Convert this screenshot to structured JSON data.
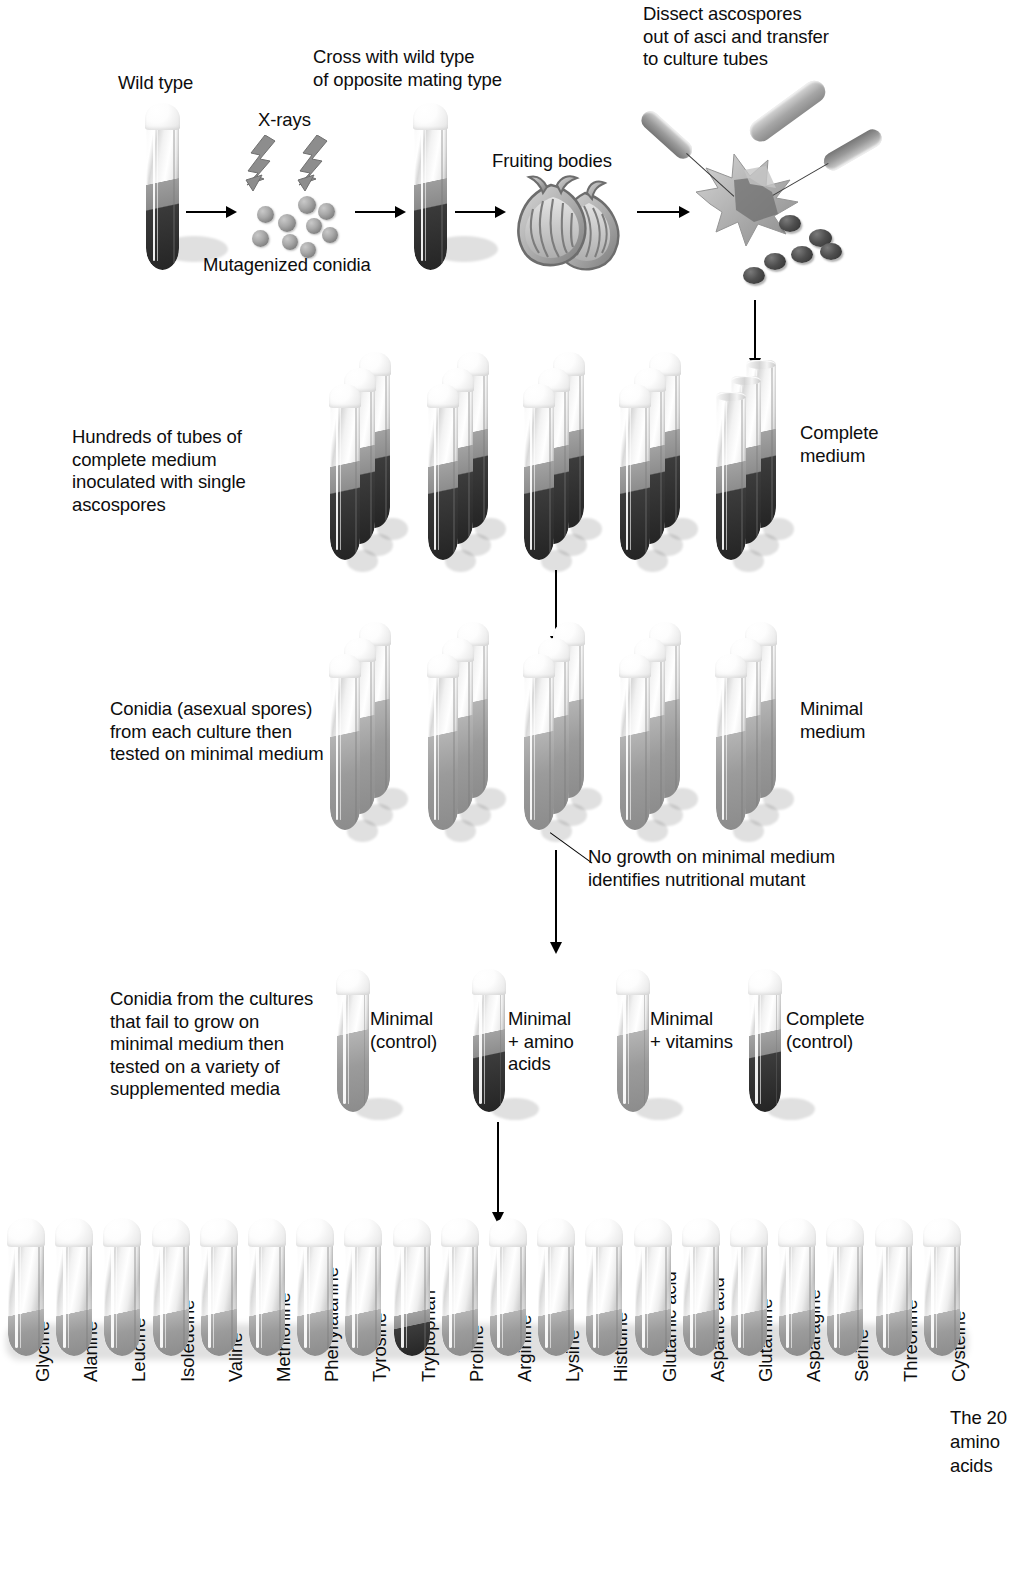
{
  "step1": {
    "wild_type_label": "Wild type",
    "xrays_label": "X-rays",
    "mutagenized_label": "Mutagenized conidia",
    "cross_label": "Cross with wild type\nof opposite mating type",
    "fruiting_bodies_label": "Fruiting bodies",
    "dissect_label": "Dissect ascospores\nout of asci and transfer\nto culture tubes"
  },
  "step2": {
    "description": "Hundreds of tubes of\ncomplete medium\ninoculated with single\nascospores",
    "medium_label": "Complete\nmedium",
    "group_count": 5,
    "tubes_per_group": 3
  },
  "step3": {
    "description": "Conidia (asexual spores)\nfrom each culture then\ntested on minimal medium",
    "medium_label": "Minimal\nmedium",
    "annotation": "No growth on minimal medium\nidentifies nutritional mutant",
    "group_count": 5,
    "tubes_per_group": 3
  },
  "step4": {
    "description": "Conidia from the cultures\nthat fail to grow on\nminimal medium then\ntested on a variety of\nsupplemented media",
    "tubes": [
      {
        "label": "Minimal\n(control)",
        "growth": false
      },
      {
        "label": "Minimal\n+ amino\nacids",
        "growth": true
      },
      {
        "label": "Minimal\n+ vitamins",
        "growth": false
      },
      {
        "label": "Complete\n(control)",
        "growth": true
      }
    ]
  },
  "step5": {
    "caption": "The 20\namino\nacids",
    "amino_acids": [
      {
        "name": "Glycine",
        "growth": false
      },
      {
        "name": "Alanine",
        "growth": false
      },
      {
        "name": "Leucine",
        "growth": false
      },
      {
        "name": "Isoleucine",
        "growth": false
      },
      {
        "name": "Valine",
        "growth": false
      },
      {
        "name": "Methionine",
        "growth": false
      },
      {
        "name": "Phenylalanine",
        "growth": false
      },
      {
        "name": "Tyrosine",
        "growth": false
      },
      {
        "name": "Tryptophan",
        "growth": true
      },
      {
        "name": "Proline",
        "growth": false
      },
      {
        "name": "Arginine",
        "growth": false
      },
      {
        "name": "Lysine",
        "growth": false
      },
      {
        "name": "Histidine",
        "growth": false
      },
      {
        "name": "Glutamic acid",
        "growth": false
      },
      {
        "name": "Aspartic acid",
        "growth": false
      },
      {
        "name": "Glutamine",
        "growth": false
      },
      {
        "name": "Asparagine",
        "growth": false
      },
      {
        "name": "Serine",
        "growth": false
      },
      {
        "name": "Threonine",
        "growth": false
      },
      {
        "name": "Cysteine",
        "growth": false
      }
    ]
  },
  "colors": {
    "text": "#0d0d0d",
    "growth_medium": "#2b2b2b",
    "plain_medium": "#8e8e8e",
    "glass": "#e8e8e8",
    "conidia": "#8a8a8a",
    "ascospore": "#3a3a3a",
    "background": "#ffffff"
  }
}
